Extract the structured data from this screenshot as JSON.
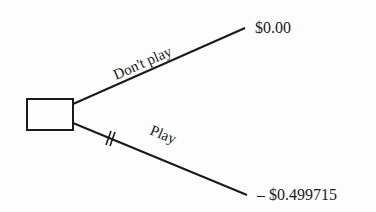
{
  "diagram": {
    "type": "decision-tree",
    "decision_node": {
      "shape": "square"
    },
    "branches": [
      {
        "label": "Don't play",
        "payoff": "$0.00",
        "pruned": false
      },
      {
        "label": "Play",
        "payoff": "– $0.499715",
        "pruned": true
      }
    ]
  },
  "colors": {
    "ink": "#1a1a1a",
    "background": "#fdfdfd"
  }
}
